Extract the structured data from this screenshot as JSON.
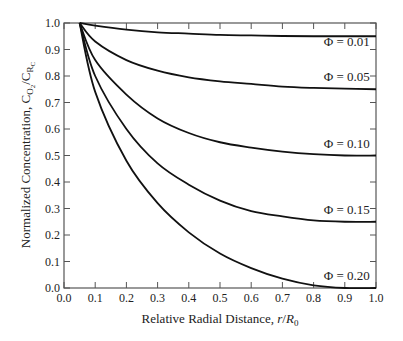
{
  "chart_data": {
    "type": "line",
    "title": "",
    "xlabel": "Relative Radial Distance, r/R0",
    "ylabel": "Normalized Concentration, C_O2/C_RC",
    "xlim": [
      0.0,
      1.0
    ],
    "ylim": [
      0.0,
      1.0
    ],
    "xticks": [
      "0.0",
      "0.1",
      "0.2",
      "0.3",
      "0.4",
      "0.5",
      "0.6",
      "0.7",
      "0.8",
      "0.9",
      "1.0"
    ],
    "yticks": [
      "0.0",
      "0.1",
      "0.2",
      "0.3",
      "0.4",
      "0.5",
      "0.6",
      "0.7",
      "0.8",
      "0.9",
      "1.0"
    ],
    "grid": false,
    "legend": "inline labels near right edge",
    "x": [
      0.05,
      0.1,
      0.2,
      0.3,
      0.4,
      0.5,
      0.6,
      0.7,
      0.8,
      0.9,
      1.0
    ],
    "series": [
      {
        "name": "Φ = 0.01",
        "values": [
          1.0,
          0.99,
          0.975,
          0.965,
          0.96,
          0.955,
          0.953,
          0.951,
          0.95,
          0.95,
          0.95
        ]
      },
      {
        "name": "Φ = 0.05",
        "values": [
          1.0,
          0.93,
          0.86,
          0.82,
          0.795,
          0.78,
          0.77,
          0.76,
          0.755,
          0.752,
          0.75
        ]
      },
      {
        "name": "Φ = 0.10",
        "values": [
          1.0,
          0.86,
          0.73,
          0.64,
          0.585,
          0.55,
          0.53,
          0.515,
          0.505,
          0.5,
          0.5
        ]
      },
      {
        "name": "Φ = 0.15",
        "values": [
          1.0,
          0.8,
          0.6,
          0.47,
          0.39,
          0.33,
          0.29,
          0.27,
          0.255,
          0.25,
          0.25
        ]
      },
      {
        "name": "Φ = 0.20",
        "values": [
          1.0,
          0.74,
          0.48,
          0.32,
          0.21,
          0.13,
          0.075,
          0.035,
          0.01,
          0.0,
          0.0
        ]
      }
    ],
    "label_positions": [
      {
        "text": "Φ = 0.01",
        "x": 0.98,
        "y": 0.915
      },
      {
        "text": "Φ = 0.05",
        "x": 0.98,
        "y": 0.783
      },
      {
        "text": "Φ = 0.10",
        "x": 0.98,
        "y": 0.53
      },
      {
        "text": "Φ = 0.15",
        "x": 0.98,
        "y": 0.28
      },
      {
        "text": "Φ = 0.20",
        "x": 0.98,
        "y": 0.03
      }
    ]
  },
  "labels": {
    "xlabel_main": "Relative Radial Distance, ",
    "xlabel_var": "r",
    "xlabel_slash": "/",
    "xlabel_R": "R",
    "xlabel_sub": "0",
    "ylabel_main": "Normalized Concentration, C",
    "ylabel_sub1": "O",
    "ylabel_sub1b": "2",
    "ylabel_slash": "/C",
    "ylabel_sub2": "R",
    "ylabel_sub2b": "C"
  },
  "style": {
    "line_color": "#111111",
    "axis_color": "#555555"
  }
}
